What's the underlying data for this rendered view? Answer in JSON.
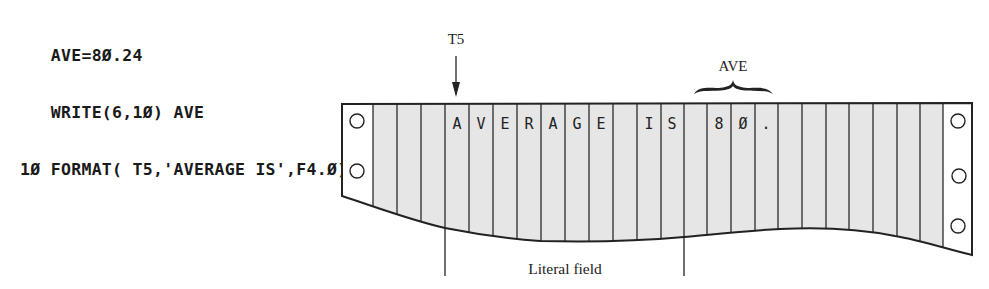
{
  "code": {
    "lines": [
      "   AVE=8Ø.24",
      "   WRITE(6,1Ø) AVE",
      "1Ø FORMAT( T5,'AVERAGE IS',F4.Ø)"
    ]
  },
  "annotations": {
    "tab_label": "T5",
    "variable_label": "AVE",
    "field_label": "Literal field"
  },
  "paper": {
    "columns": [
      "",
      "",
      "",
      "A",
      "V",
      "E",
      "R",
      "A",
      "G",
      "E",
      "",
      "I",
      "S",
      "",
      "8",
      "Ø",
      ".",
      "",
      "",
      "",
      "",
      "",
      "",
      "",
      ""
    ],
    "column_fill": "#e6e6e6",
    "line_color": "#2a2a2a"
  }
}
